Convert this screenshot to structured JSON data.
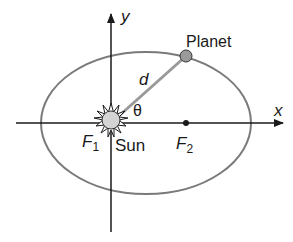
{
  "diagram": {
    "type": "orbital-ellipse",
    "labels": {
      "y_axis": "y",
      "x_axis": "x",
      "planet": "Planet",
      "distance": "d",
      "angle": "θ",
      "focus1": "F",
      "focus1_sub": "1",
      "sun": "Sun",
      "focus2": "F",
      "focus2_sub": "2"
    },
    "colors": {
      "ellipse": "#7a7a7a",
      "axes": "#1a1a1a",
      "sun_fill": "#d4d4d4",
      "planet_fill": "#9a9a9a",
      "radius_line": "#9a9a9a"
    }
  }
}
